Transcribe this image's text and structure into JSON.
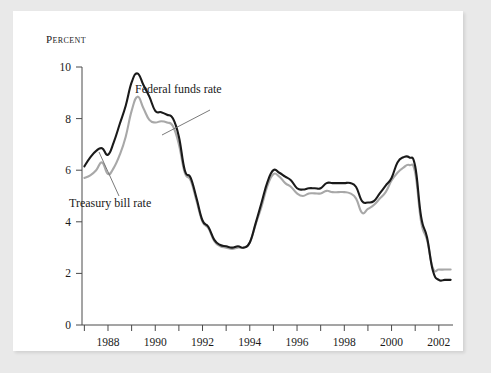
{
  "figure": {
    "background_color": "#e9e9e9",
    "panel_color": "#ffffff"
  },
  "chart_data": {
    "type": "line",
    "title": "",
    "subtitle": "",
    "xlabel": "",
    "ylabel": "Percent",
    "ylabel_display": "Percent",
    "xlim": [
      1986.9,
      2002.6
    ],
    "ylim": [
      0,
      10
    ],
    "grid": false,
    "legend_position": "inline-annotations",
    "y_ticks": [
      0,
      2,
      4,
      6,
      8,
      10
    ],
    "y_tick_labels": [
      "0",
      "2",
      "4",
      "6",
      "8",
      "10"
    ],
    "x_ticks": [
      1987,
      1988,
      1989,
      1990,
      1991,
      1992,
      1993,
      1994,
      1995,
      1996,
      1997,
      1998,
      1999,
      2000,
      2001,
      2002
    ],
    "x_tick_labels_shown": [
      "1988",
      "1990",
      "1992",
      "1994",
      "1996",
      "1998",
      "2000",
      "2002"
    ],
    "x_labeled_ticks": [
      1988,
      1990,
      1992,
      1994,
      1996,
      1998,
      2000,
      2002
    ],
    "annotations": [
      {
        "name": "federal-funds-rate-label",
        "text": "Federal funds rate",
        "x_px": 134,
        "y_px": 91
      },
      {
        "name": "treasury-bill-rate-label",
        "text": "Treasury bill rate",
        "x_px": 69,
        "y_px": 201
      }
    ],
    "series": [
      {
        "name": "Federal funds rate",
        "color": "#1a1a1a",
        "width": 2.1,
        "x": [
          1987.0,
          1987.25,
          1987.5,
          1987.75,
          1988.0,
          1988.25,
          1988.5,
          1988.75,
          1989.0,
          1989.25,
          1989.5,
          1989.75,
          1990.0,
          1990.25,
          1990.5,
          1990.75,
          1991.0,
          1991.25,
          1991.5,
          1991.75,
          1992.0,
          1992.25,
          1992.5,
          1992.75,
          1993.0,
          1993.25,
          1993.5,
          1993.75,
          1994.0,
          1994.25,
          1994.5,
          1994.75,
          1995.0,
          1995.25,
          1995.5,
          1995.75,
          1996.0,
          1996.25,
          1996.5,
          1996.75,
          1997.0,
          1997.25,
          1997.5,
          1997.75,
          1998.0,
          1998.25,
          1998.5,
          1998.75,
          1999.0,
          1999.25,
          1999.5,
          1999.75,
          2000.0,
          2000.25,
          2000.5,
          2000.75,
          2001.0,
          2001.25,
          2001.5,
          2001.75,
          2002.0,
          2002.25,
          2002.5
        ],
        "values": [
          6.15,
          6.5,
          6.75,
          6.85,
          6.6,
          7.1,
          7.8,
          8.5,
          9.4,
          9.75,
          9.3,
          8.85,
          8.3,
          8.25,
          8.15,
          8.0,
          7.3,
          6.0,
          5.7,
          4.9,
          4.05,
          3.8,
          3.3,
          3.1,
          3.05,
          3.0,
          3.05,
          3.0,
          3.2,
          3.95,
          4.75,
          5.55,
          6.0,
          5.9,
          5.75,
          5.6,
          5.3,
          5.25,
          5.3,
          5.3,
          5.3,
          5.5,
          5.5,
          5.5,
          5.5,
          5.5,
          5.35,
          4.8,
          4.75,
          4.8,
          5.1,
          5.4,
          5.7,
          6.3,
          6.5,
          6.5,
          6.15,
          4.2,
          3.4,
          2.1,
          1.75,
          1.75,
          1.75
        ]
      },
      {
        "name": "Treasury bill rate",
        "color": "#a8a8a8",
        "width": 2.1,
        "x": [
          1987.0,
          1987.25,
          1987.5,
          1987.75,
          1988.0,
          1988.25,
          1988.5,
          1988.75,
          1989.0,
          1989.25,
          1989.5,
          1989.75,
          1990.0,
          1990.25,
          1990.5,
          1990.75,
          1991.0,
          1991.25,
          1991.5,
          1991.75,
          1992.0,
          1992.25,
          1992.5,
          1992.75,
          1993.0,
          1993.25,
          1993.5,
          1993.75,
          1994.0,
          1994.25,
          1994.5,
          1994.75,
          1995.0,
          1995.25,
          1995.5,
          1995.75,
          1996.0,
          1996.25,
          1996.5,
          1996.75,
          1997.0,
          1997.25,
          1997.5,
          1997.75,
          1998.0,
          1998.25,
          1998.5,
          1998.75,
          1999.0,
          1999.25,
          1999.5,
          1999.75,
          2000.0,
          2000.25,
          2000.5,
          2000.75,
          2001.0,
          2001.25,
          2001.5,
          2001.75,
          2002.0,
          2002.25,
          2002.5
        ],
        "values": [
          5.7,
          5.8,
          6.0,
          6.3,
          5.85,
          6.1,
          6.6,
          7.3,
          8.3,
          8.85,
          8.4,
          7.95,
          7.85,
          7.9,
          7.85,
          7.7,
          7.0,
          5.9,
          5.6,
          4.8,
          4.0,
          3.75,
          3.25,
          3.05,
          3.0,
          2.95,
          3.0,
          3.0,
          3.2,
          3.9,
          4.6,
          5.4,
          5.85,
          5.75,
          5.5,
          5.35,
          5.1,
          5.0,
          5.1,
          5.1,
          5.1,
          5.2,
          5.15,
          5.15,
          5.15,
          5.1,
          4.9,
          4.35,
          4.5,
          4.65,
          4.9,
          5.15,
          5.6,
          5.9,
          6.1,
          6.2,
          5.9,
          4.0,
          3.3,
          2.2,
          2.15,
          2.15,
          2.15
        ]
      }
    ]
  }
}
